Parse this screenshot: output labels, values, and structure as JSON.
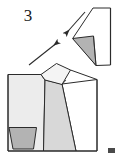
{
  "figure": {
    "name": "origami-fold-step-diagram",
    "step_number": "3",
    "background_color": "#ffffff",
    "line_color": "#2b2b2b",
    "fill_light": "#ececec",
    "fill_mid": "#d8d8d8",
    "fill_dark": "#b3b3b3",
    "fill_white": "#ffffff",
    "stroke_width": "1"
  },
  "labels": {
    "step_number": "3"
  },
  "shapes": {
    "upper_unit": {
      "name": "upper-paper-unit",
      "outline_points": "73,38 93,8 110,8 110,65 96,65",
      "white_face_points": "93,8 110,8 110,65 96,65 73,38",
      "gray_triangle_points": "73,38 93,36 96,65",
      "gray_triangle_fill": "#b3b3b3",
      "white_face_fill": "#ffffff"
    },
    "lower_unit": {
      "name": "lower-paper-unit",
      "body_points": "8,74 40,74 56,64 70,70 97,80 97,150 8,150",
      "left_face_points": "8,74 40,74 43,150 8,150",
      "left_face_fill": "#ececec",
      "center_flap_points": "40,74 56,64 70,70 62,84 45,80",
      "center_flap_fill": "#f2f2f2",
      "center_wedge_points": "45,80 62,84 76,150 43,150",
      "center_wedge_fill": "#d8d8d8",
      "right_face_points": "62,84 97,80 97,150 76,150",
      "right_face_fill": "#ffffff",
      "dark_trapezoid_points": "9,127 36,127 33,148 13,148",
      "dark_trapezoid_fill": "#b3b3b3"
    }
  },
  "arrows": [
    {
      "name": "fold-arrow-down-left",
      "direction": "down-left",
      "tail_x": 84,
      "tail_y": 13,
      "head_x": 65,
      "head_y": 35,
      "color": "#2b2b2b"
    },
    {
      "name": "fold-arrow-up-right",
      "direction": "up-right",
      "tail_x": 30,
      "tail_y": 64,
      "head_x": 58,
      "head_y": 42,
      "color": "#2b2b2b"
    }
  ],
  "marks": {
    "corner_mark": {
      "name": "bottom-right-corner-mark",
      "x": 108,
      "y": 148,
      "width": 7,
      "height": 5,
      "color": "#4a4a4a"
    }
  }
}
